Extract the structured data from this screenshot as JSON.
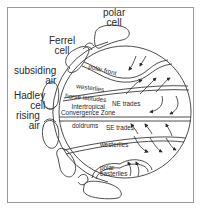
{
  "diagram": {
    "cells": {
      "polar": "polar\ncell",
      "polar_line1": "polar",
      "polar_line2": "cell",
      "ferrel_line1": "Ferrel",
      "ferrel_line2": "cell",
      "hadley_line1": "Hadley",
      "hadley_line2": "cell"
    },
    "air": {
      "subsiding_line1": "subsiding",
      "subsiding_line2": "air",
      "rising_line1": "rising",
      "rising_line2": "air"
    },
    "zones": {
      "polar_front": "polar front",
      "westerlies_north": "westerlies",
      "horse_latitudes": "horse latitudes",
      "ne_trades": "NE trades",
      "itcz_line1": "Intertropical",
      "itcz_line2": "Convergence Zone",
      "doldrums": "doldrums",
      "se_trades": "SE trades",
      "westerlies_south": "westerlies",
      "polar_easterlies_line1": "polar",
      "polar_easterlies_line2": "easterlies"
    },
    "colors": {
      "line": "#3a3a3a",
      "frame": "#9a9a9a",
      "background": "#ffffff"
    }
  }
}
